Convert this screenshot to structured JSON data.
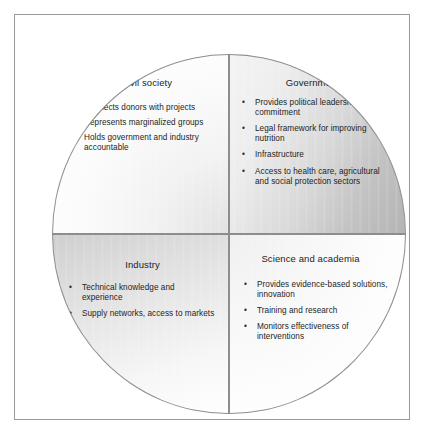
{
  "figure": {
    "type": "quadrant-circle-diagram",
    "bullet_glyph": "•",
    "colors": {
      "frame_border": "#9a9a9a",
      "quadrant_border": "#8d8d8d",
      "text": "#1d1d1d",
      "civil_society_fill": "#f4f4f4",
      "government_fill": "#c2c2c2",
      "industry_fill": "#dcdcdc",
      "science_fill": "#fbfbfb"
    },
    "quadrants": [
      {
        "key": "civil_society",
        "title": "Civil society",
        "position": "top-left",
        "bullets": [
          "Connects donors with projects",
          "Represents marginalized groups",
          "Holds government and industry accountable"
        ]
      },
      {
        "key": "government",
        "title": "Government",
        "position": "top-right",
        "bullets": [
          "Provides political leadership, commitment",
          "Legal framework for improving nutrition",
          "Infrastructure",
          "Access to health care, agricultural and social protection sectors"
        ]
      },
      {
        "key": "industry",
        "title": "Industry",
        "position": "bottom-left",
        "bullets": [
          "Technical knowledge and experience",
          "Supply networks, access to markets"
        ]
      },
      {
        "key": "science_and_academia",
        "title": "Science and academia",
        "position": "bottom-right",
        "bullets": [
          "Provides evidence-based solutions, innovation",
          "Training and research",
          "Monitors effectiveness of interventions"
        ]
      }
    ]
  }
}
